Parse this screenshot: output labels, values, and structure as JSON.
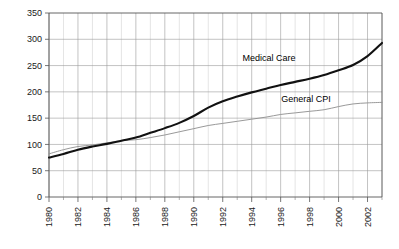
{
  "chart_data": {
    "type": "line",
    "title": "",
    "subtitle": "",
    "xlabel": "",
    "ylabel": "",
    "xlim": [
      1980,
      2003
    ],
    "ylim": [
      0,
      350
    ],
    "grid": "both-axes-visible",
    "legend_position": "inline-annotations",
    "x": [
      1980,
      1981,
      1982,
      1983,
      1984,
      1985,
      1986,
      1987,
      1988,
      1989,
      1990,
      1991,
      1992,
      1993,
      1994,
      1995,
      1996,
      1997,
      1998,
      1999,
      2000,
      2001,
      2002,
      2003
    ],
    "y_ticks": [
      0,
      50,
      100,
      150,
      200,
      250,
      300,
      350
    ],
    "x_ticks_major": [
      1980,
      1982,
      1984,
      1986,
      1988,
      1990,
      1992,
      1994,
      1996,
      1998,
      2000,
      2002
    ],
    "x_tick_labels": [
      "1980",
      "1982",
      "1984",
      "1986",
      "1988",
      "1990",
      "1992",
      "1994",
      "1996",
      "1998",
      "2000",
      "2002"
    ],
    "y_tick_labels": [
      "0",
      "50",
      "100",
      "150",
      "200",
      "250",
      "300",
      "350"
    ],
    "series": [
      {
        "name": "Medical Care",
        "color": "#111111",
        "style": "solid-thick",
        "values": [
          75,
          82,
          90,
          96,
          101,
          107,
          113,
          122,
          131,
          141,
          154,
          170,
          182,
          191,
          199,
          206,
          213,
          219,
          225,
          232,
          241,
          251,
          268,
          293
        ]
      },
      {
        "name": "General CPI",
        "color": "#8d8d8d",
        "style": "solid-thin",
        "values": [
          82,
          90,
          96,
          99,
          103,
          107,
          109,
          113,
          118,
          124,
          130,
          136,
          140,
          144,
          148,
          152,
          157,
          160,
          163,
          166,
          172,
          177,
          179,
          180
        ]
      }
    ],
    "annotations": [
      {
        "label": "Medical Care",
        "series": "Medical Care",
        "x_px": 269,
        "y_px": 61
      },
      {
        "label": "General CPI",
        "series": "General CPI",
        "x_px": 306,
        "y_px": 102
      }
    ]
  }
}
